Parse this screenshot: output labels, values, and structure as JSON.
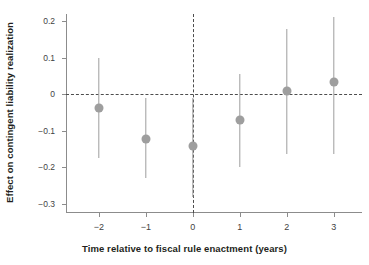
{
  "chart_data": {
    "type": "scatter",
    "title": "",
    "xlabel": "Time relative to fiscal rule enactment (years)",
    "ylabel": "Effect on contingent liability realization",
    "x": [
      -2,
      -1,
      0,
      1,
      2,
      3
    ],
    "xtick_labels": [
      "−2",
      "−1",
      "0",
      "1",
      "2",
      "3"
    ],
    "ytick_labels": [
      "0.2",
      "0.1",
      "0",
      "−0.1",
      "−0.2",
      "−0.3"
    ],
    "ytick_values": [
      0.2,
      0.1,
      0,
      -0.1,
      -0.2,
      -0.3
    ],
    "values": [
      -0.037,
      -0.121,
      -0.142,
      -0.071,
      0.008,
      0.034
    ],
    "ci_low": [
      -0.175,
      -0.229,
      -0.282,
      -0.2,
      -0.163,
      -0.163
    ],
    "ci_high": [
      0.1,
      -0.011,
      -0.011,
      0.055,
      0.179,
      0.213
    ],
    "xlim": [
      -2.7,
      3.6
    ],
    "ylim": [
      -0.325,
      0.22
    ],
    "grid": false,
    "legend": "none",
    "reference_lines": {
      "horizontal_zero": 0,
      "vertical_zero": 0
    },
    "series_name": "Effect on contingent liability realization",
    "colors": {
      "marker": "#9e9e9e",
      "whisker": "#9e9e9e",
      "axis": "#8c8c8c",
      "reference": "#4d4d4d",
      "text": "#231f20",
      "tick_text": "#3f3f3f",
      "background": "#ffffff"
    }
  }
}
